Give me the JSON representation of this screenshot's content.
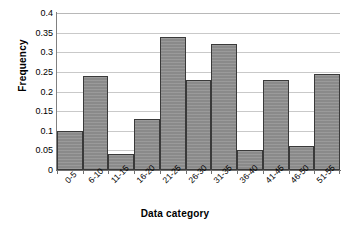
{
  "chart_data": {
    "type": "bar",
    "title": "",
    "xlabel": "Data category",
    "ylabel": "Frequency",
    "categories": [
      "0-5",
      "6-10",
      "11-15",
      "16-20",
      "21-25",
      "26-30",
      "31-35",
      "36-40",
      "41-45",
      "46-50",
      "51-55"
    ],
    "values": [
      0.1,
      0.24,
      0.04,
      0.13,
      0.34,
      0.23,
      0.32,
      0.05,
      0.23,
      0.06,
      0.245
    ],
    "ylim": [
      0,
      0.4
    ],
    "yticks": [
      "0",
      "0.05",
      "0.1",
      "0.15",
      "0.2",
      "0.25",
      "0.3",
      "0.35",
      "0.4"
    ],
    "ytick_values": [
      0,
      0.05,
      0.1,
      0.15,
      0.2,
      0.25,
      0.3,
      0.35,
      0.4
    ],
    "grid": true,
    "legend": "none",
    "bar_color": "#8a8a8a",
    "bar_border_color": "#3a3a3a",
    "gridline_color": "#c9c9c9",
    "axis_color": "#707070"
  }
}
